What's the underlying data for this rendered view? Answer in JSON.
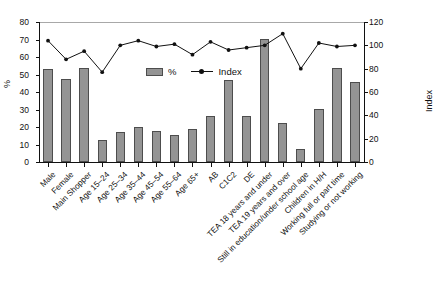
{
  "chart_data": {
    "type": "bar",
    "title": "",
    "xlabel": "",
    "ylabel": "%",
    "ylabel_right": "Index",
    "ylim": [
      0,
      80
    ],
    "ylim_right": [
      0,
      120
    ],
    "yticks": [
      0,
      10,
      20,
      30,
      40,
      50,
      60,
      70,
      80
    ],
    "yticks_right": [
      0,
      20,
      40,
      60,
      80,
      100,
      120
    ],
    "grid": false,
    "legend_position": "upper-center",
    "categories": [
      "Male",
      "Female",
      "Main Shopper",
      "Age 15–24",
      "Age 25–34",
      "Age 35–44",
      "Age 45–54",
      "Age 55–64",
      "Age 65+",
      "AB",
      "C1C2",
      "DE",
      "TEA 18 years and under",
      "TEA 19 years and over",
      "Still in education/under school age",
      "Children in H/H",
      "Working full or part time",
      "Studying or not working"
    ],
    "series": [
      {
        "name": "%",
        "type": "bar",
        "axis": "left",
        "color": "#949494",
        "values": [
          53,
          47.5,
          53.5,
          12.5,
          17,
          20,
          17.5,
          15.5,
          19,
          26.5,
          47,
          26.5,
          70.5,
          22.5,
          7.5,
          30.5,
          54,
          45.5
        ]
      },
      {
        "name": "Index",
        "type": "line",
        "axis": "right",
        "color": "#111111",
        "values": [
          104,
          88,
          95,
          77,
          100,
          104,
          99,
          101,
          92,
          103,
          96,
          98,
          100,
          110,
          80,
          102,
          99,
          100
        ]
      }
    ]
  },
  "legend": {
    "items": [
      {
        "label": "%",
        "marker": "bar-swatch"
      },
      {
        "label": "Index",
        "marker": "line-marker"
      }
    ]
  },
  "axes": {
    "left_title": "%",
    "right_title": "Index"
  }
}
